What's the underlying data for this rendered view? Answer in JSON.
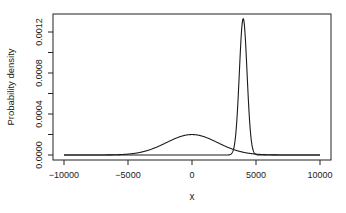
{
  "chart_data": {
    "type": "line",
    "title": "",
    "xlabel": "x",
    "ylabel": "Probability density",
    "xlim": [
      -10000,
      10000
    ],
    "ylim": [
      0,
      0.0013
    ],
    "grid": false,
    "legend": null,
    "x_ticks": [
      -10000,
      -5000,
      0,
      5000,
      10000
    ],
    "x_tick_labels": [
      "-10000",
      "-5000",
      "0",
      "5000",
      "10000"
    ],
    "y_ticks": [
      0,
      0.0002,
      0.0004,
      0.0006,
      0.0008,
      0.001,
      0.0012
    ],
    "y_tick_labels": [
      "0.0000",
      "",
      "0.0004",
      "",
      "0.0008",
      "",
      "0.0012"
    ],
    "series": [
      {
        "name": "broad normal density",
        "distribution": "normal",
        "mean": 0,
        "sd": 2000,
        "peak_x": 0,
        "peak_y": 0.0002,
        "x_range": [
          -10000,
          10000
        ]
      },
      {
        "name": "narrow normal density",
        "distribution": "normal",
        "mean": 4000,
        "sd": 300,
        "peak_x": 4000,
        "peak_y": 0.00133,
        "x_range": [
          -10000,
          10000
        ]
      }
    ]
  },
  "axes": {
    "xlabel": "x",
    "ylabel": "Probability density"
  }
}
